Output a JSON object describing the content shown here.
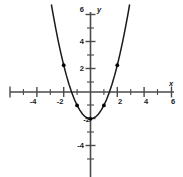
{
  "chart_data": {
    "type": "line",
    "title": "",
    "xlabel": "x",
    "ylabel": "y",
    "equation": "y = x^2 - 2",
    "xlim": [
      -6.6,
      6.9
    ],
    "ylim": [
      -6.3,
      6.3
    ],
    "grid": false,
    "legend": null,
    "x_ticks": [
      -6,
      -5,
      -4,
      -3,
      -2,
      -1,
      1,
      2,
      3,
      4,
      5,
      6
    ],
    "x_tick_labels": [
      "",
      "",
      "-4",
      "",
      "-2",
      "",
      "",
      "2",
      "",
      "4",
      "",
      "6"
    ],
    "y_ticks": [
      -4,
      -2,
      2,
      4,
      6
    ],
    "y_tick_labels": [
      "-4",
      "-2",
      "2",
      "4",
      "6"
    ],
    "points": [
      {
        "x": -2,
        "y": 2
      },
      {
        "x": -1,
        "y": -1
      },
      {
        "x": 0,
        "y": -2
      },
      {
        "x": 1,
        "y": -1
      },
      {
        "x": 2,
        "y": 2
      }
    ],
    "curve": [
      {
        "x": -2.92,
        "y": 6.53
      },
      {
        "x": -2.8,
        "y": 5.84
      },
      {
        "x": -2.6,
        "y": 4.76
      },
      {
        "x": -2.4,
        "y": 3.76
      },
      {
        "x": -2.2,
        "y": 2.84
      },
      {
        "x": -2.0,
        "y": 2.0
      },
      {
        "x": -1.8,
        "y": 1.24
      },
      {
        "x": -1.6,
        "y": 0.56
      },
      {
        "x": -1.4,
        "y": -0.04
      },
      {
        "x": -1.2,
        "y": -0.56
      },
      {
        "x": -1.0,
        "y": -1.0
      },
      {
        "x": -0.8,
        "y": -1.36
      },
      {
        "x": -0.6,
        "y": -1.64
      },
      {
        "x": -0.4,
        "y": -1.84
      },
      {
        "x": -0.2,
        "y": -1.96
      },
      {
        "x": 0.0,
        "y": -2.0
      },
      {
        "x": 0.2,
        "y": -1.96
      },
      {
        "x": 0.4,
        "y": -1.84
      },
      {
        "x": 0.6,
        "y": -1.64
      },
      {
        "x": 0.8,
        "y": -1.36
      },
      {
        "x": 1.0,
        "y": -1.0
      },
      {
        "x": 1.2,
        "y": -0.56
      },
      {
        "x": 1.4,
        "y": -0.04
      },
      {
        "x": 1.6,
        "y": 0.56
      },
      {
        "x": 1.8,
        "y": 1.24
      },
      {
        "x": 2.0,
        "y": 2.0
      },
      {
        "x": 2.2,
        "y": 2.84
      },
      {
        "x": 2.4,
        "y": 3.76
      },
      {
        "x": 2.6,
        "y": 4.76
      },
      {
        "x": 2.8,
        "y": 5.84
      },
      {
        "x": 2.92,
        "y": 6.53
      }
    ]
  },
  "labels": {
    "x_axis": "x",
    "y_axis": "y",
    "x_neg4": "-4",
    "x_neg2": "-2",
    "x_pos2": "2",
    "x_pos4": "4",
    "x_pos6": "6",
    "y_pos6": "6",
    "y_pos4": "4",
    "y_pos2": "2",
    "y_neg2": "-2",
    "y_neg4": "-4"
  },
  "colors": {
    "axis": "#4a4a4a",
    "curve": "#1a1a1a",
    "point": "#000000",
    "background": "#ffffff"
  }
}
